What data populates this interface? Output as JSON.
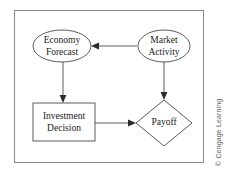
{
  "figure": {
    "credit": "© Cengage Learning",
    "background_color": "#ffffff",
    "frame_color": "#8d8d8d",
    "shape_stroke_color": "#4a4a4a",
    "text_color": "#1a1a1a"
  },
  "nodes": [
    {
      "id": "economy-forecast",
      "shape": "ellipse",
      "label_line1": "Economy",
      "label_line2": "Forecast",
      "cx": 62,
      "cy": 46,
      "rx": 29,
      "ry": 16
    },
    {
      "id": "market-activity",
      "shape": "ellipse",
      "label_line1": "Market",
      "label_line2": "Activity",
      "cx": 164,
      "cy": 46,
      "rx": 26,
      "ry": 16
    },
    {
      "id": "investment-decision",
      "shape": "rectangle",
      "label_line1": "Investment",
      "label_line2": "Decision",
      "x": 33,
      "y": 103,
      "width": 62,
      "height": 38
    },
    {
      "id": "payoff",
      "shape": "diamond",
      "label_line1": "Payoff",
      "label_line2": "",
      "cx": 164,
      "cy": 123,
      "rx": 28,
      "ry": 23
    }
  ],
  "edges": [
    {
      "id": "market-to-economy",
      "from": "market-activity",
      "to": "economy-forecast",
      "direction": "left"
    },
    {
      "id": "economy-to-investment",
      "from": "economy-forecast",
      "to": "investment-decision",
      "direction": "down"
    },
    {
      "id": "market-to-payoff",
      "from": "market-activity",
      "to": "payoff",
      "direction": "down"
    },
    {
      "id": "investment-to-payoff",
      "from": "investment-decision",
      "to": "payoff",
      "direction": "right"
    }
  ]
}
